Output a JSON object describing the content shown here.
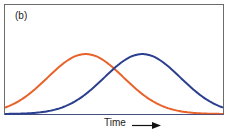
{
  "chart_data": {
    "type": "line",
    "title": "",
    "panel_label": "(b)",
    "xlabel": "Time",
    "ylabel": "",
    "xlim": [
      0,
      1
    ],
    "ylim": [
      0,
      1
    ],
    "grid": false,
    "legend": null,
    "annotations": [
      "(b)",
      "Time →"
    ],
    "series": [
      {
        "name": "orange curve",
        "color": "#e8622a",
        "shape": "gaussian",
        "peak_x": 0.37,
        "peak_y": 0.55,
        "sigma": 0.175
      },
      {
        "name": "blue curve",
        "color": "#2b3f8f",
        "shape": "gaussian",
        "peak_x": 0.63,
        "peak_y": 0.55,
        "sigma": 0.175
      }
    ],
    "x": [
      0.0,
      0.1,
      0.2,
      0.3,
      0.37,
      0.45,
      0.5,
      0.6,
      0.63,
      0.7,
      0.8,
      0.9,
      1.0
    ],
    "series_values": {
      "orange curve": [
        0.06,
        0.17,
        0.34,
        0.51,
        0.55,
        0.5,
        0.42,
        0.24,
        0.18,
        0.1,
        0.04,
        0.01,
        0.0
      ],
      "blue curve": [
        0.0,
        0.01,
        0.04,
        0.1,
        0.18,
        0.3,
        0.42,
        0.54,
        0.55,
        0.51,
        0.34,
        0.17,
        0.06
      ]
    }
  },
  "labels": {
    "panel": "(b)",
    "x_axis": "Time"
  },
  "colors": {
    "orange": "#e8622a",
    "blue": "#2b3f8f",
    "frame": "#666666"
  }
}
